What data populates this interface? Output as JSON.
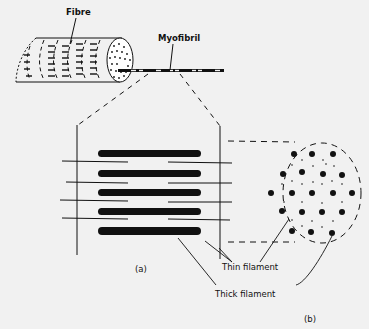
{
  "diagram": {
    "labels": {
      "fibre": "Fibre",
      "myofibril": "Myofibril",
      "thin_filament": "Thin filament",
      "thick_filament": "Thick filament",
      "panel_a": "(a)",
      "panel_b": "(b)"
    },
    "colors": {
      "background": "#f1f1f1",
      "ink": "#111111"
    }
  }
}
